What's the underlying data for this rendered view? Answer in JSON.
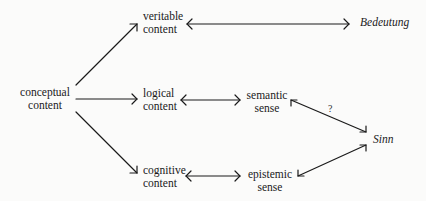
{
  "diagram": {
    "nodes": {
      "conceptual_content": {
        "line1": "conceptual",
        "line2": "content"
      },
      "veritable_content": {
        "line1": "veritable",
        "line2": "content"
      },
      "bedeutung": {
        "label": "Bedeutung"
      },
      "logical_content": {
        "line1": "logical",
        "line2": "content"
      },
      "semantic_sense": {
        "line1": "semantic",
        "line2": "sense"
      },
      "cognitive_content": {
        "line1": "cognitive",
        "line2": "content"
      },
      "epistemic_sense": {
        "line1": "epistemic",
        "line2": "sense"
      },
      "sinn": {
        "label": "Sinn"
      }
    },
    "edge_labels": {
      "semantic_sinn": "?"
    },
    "edges": [
      {
        "from": "conceptual content",
        "to": "veritable content",
        "type": "directed"
      },
      {
        "from": "conceptual content",
        "to": "logical content",
        "type": "directed"
      },
      {
        "from": "conceptual content",
        "to": "cognitive content",
        "type": "directed"
      },
      {
        "from": "veritable content",
        "to": "Bedeutung",
        "type": "bidirectional"
      },
      {
        "from": "logical content",
        "to": "semantic sense",
        "type": "bidirectional"
      },
      {
        "from": "cognitive content",
        "to": "epistemic sense",
        "type": "bidirectional"
      },
      {
        "from": "semantic sense",
        "to": "Sinn",
        "type": "bidirectional",
        "label": "?"
      },
      {
        "from": "epistemic sense",
        "to": "Sinn",
        "type": "bidirectional"
      }
    ],
    "colors": {
      "line": "#1a1a1a",
      "background": "#fbfbfa"
    }
  }
}
